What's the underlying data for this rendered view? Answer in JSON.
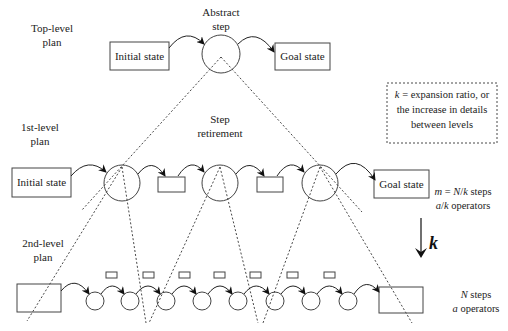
{
  "colors": {
    "background": "#ffffff",
    "line": "#222222",
    "text": "#222222"
  },
  "top_level": {
    "label_line1": "Top-level",
    "label_line2": "plan",
    "step_label_line1": "Abstract",
    "step_label_line2": "step",
    "initial_state": "Initial state",
    "goal_state": "Goal state"
  },
  "first_level": {
    "label_line1": "1st-level",
    "label_line2": "plan",
    "annotation_line1": "Step",
    "annotation_line2": "retirement",
    "initial_state": "Initial state",
    "goal_state": "Goal state",
    "stats_line1": [
      {
        "t": "m",
        "italic": true
      },
      {
        "t": " = ",
        "italic": false
      },
      {
        "t": "N",
        "italic": true
      },
      {
        "t": "/",
        "italic": false
      },
      {
        "t": "k",
        "italic": true
      },
      {
        "t": " steps",
        "italic": false
      }
    ],
    "stats_line2": [
      {
        "t": "a",
        "italic": true
      },
      {
        "t": "/",
        "italic": false
      },
      {
        "t": "k",
        "italic": true
      },
      {
        "t": " operators",
        "italic": false
      }
    ]
  },
  "second_level": {
    "label_line1": "2nd-level",
    "label_line2": "plan",
    "step_count": 8,
    "operator_count": 7,
    "stats_line1": [
      {
        "t": "N",
        "italic": true
      },
      {
        "t": " steps",
        "italic": false
      }
    ],
    "stats_line2": [
      {
        "t": "a",
        "italic": true
      },
      {
        "t": " operators",
        "italic": false
      }
    ]
  },
  "expansion_arrow": {
    "label": "k"
  },
  "legend": {
    "line1": [
      {
        "t": "k",
        "italic": true
      },
      {
        "t": " = expansion ratio, or",
        "italic": false
      }
    ],
    "line2": "the increase in details",
    "line3": "between levels"
  }
}
